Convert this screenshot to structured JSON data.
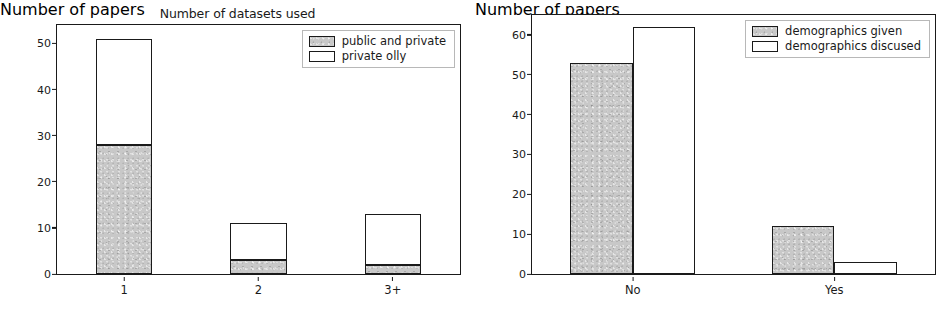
{
  "figure": {
    "panels": [
      {
        "id": "left",
        "title": "Number of datasets used",
        "ylabel": "Number of papers",
        "categories": [
          "1",
          "2",
          "3+"
        ],
        "yticks": [
          "0",
          "10",
          "20",
          "30",
          "40",
          "50"
        ],
        "legend": [
          {
            "label": "public and private",
            "style": "gray"
          },
          {
            "label": "private olly",
            "style": "white"
          }
        ]
      },
      {
        "id": "right",
        "title": "",
        "ylabel": "Number of papers",
        "categories": [
          "No",
          "Yes"
        ],
        "yticks": [
          "0",
          "10",
          "20",
          "30",
          "40",
          "50",
          "60"
        ],
        "legend": [
          {
            "label": "demographics given",
            "style": "gray"
          },
          {
            "label": "demographics discused",
            "style": "white"
          }
        ]
      }
    ]
  },
  "chart_data": [
    {
      "type": "bar",
      "subtype": "stacked",
      "title": "Number of datasets used",
      "xlabel": "",
      "ylabel": "Number of papers",
      "categories": [
        "1",
        "2",
        "3+"
      ],
      "ylim": [
        0,
        54
      ],
      "yticks": [
        0,
        10,
        20,
        30,
        40,
        50
      ],
      "grid": false,
      "legend_position": "upper right",
      "series": [
        {
          "name": "public and private",
          "values": [
            28,
            3,
            2
          ],
          "color": "#c8c8c8"
        },
        {
          "name": "private olly",
          "values": [
            23,
            8,
            11
          ],
          "color": "#ffffff"
        }
      ],
      "totals": [
        51,
        11,
        13
      ]
    },
    {
      "type": "bar",
      "subtype": "grouped",
      "title": "",
      "xlabel": "",
      "ylabel": "Number of papers",
      "categories": [
        "No",
        "Yes"
      ],
      "ylim": [
        0,
        65
      ],
      "yticks": [
        0,
        10,
        20,
        30,
        40,
        50,
        60
      ],
      "grid": false,
      "legend_position": "upper right",
      "series": [
        {
          "name": "demographics given",
          "values": [
            53,
            12
          ],
          "color": "#c8c8c8"
        },
        {
          "name": "demographics discused",
          "values": [
            62,
            3
          ],
          "color": "#ffffff"
        }
      ]
    }
  ]
}
